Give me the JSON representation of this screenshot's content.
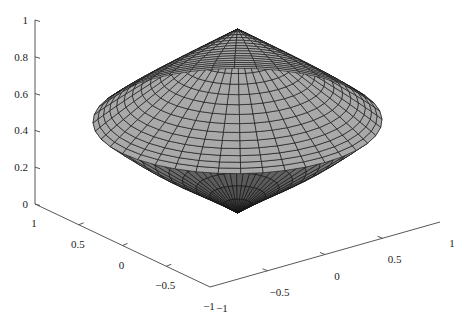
{
  "chart_data": {
    "type": "surface3d",
    "title": "",
    "xlabel": "",
    "ylabel": "",
    "zlabel": "",
    "xlim": [
      -1,
      1
    ],
    "ylim": [
      -1,
      1
    ],
    "zlim": [
      0,
      1
    ],
    "grid": false,
    "surface": {
      "top_apex": [
        0,
        0,
        1
      ],
      "bottom_apex": [
        0,
        0,
        0
      ],
      "rim_radius": 1.0,
      "rim_z": 0.5,
      "meridians": 40,
      "upper_rings": 16,
      "lower_rings": 10,
      "face_color": "#a9a9a9",
      "edge_color": "#111111"
    },
    "axes": {
      "z": {
        "ticks": [
          0,
          0.2,
          0.4,
          0.6,
          0.8,
          1
        ],
        "labels": [
          "0",
          "0.2",
          "0.4",
          "0.6",
          "0.8",
          "1"
        ]
      },
      "y_left": {
        "ticks": [
          1,
          0.5,
          0,
          -0.5,
          -1
        ],
        "labels": [
          "1",
          "0.5",
          "0",
          "−0.5",
          "−1"
        ]
      },
      "x_right": {
        "ticks": [
          -1,
          -0.5,
          0,
          0.5,
          1
        ],
        "labels": [
          "−1",
          "−0.5",
          "0",
          "0.5",
          "1"
        ]
      }
    }
  }
}
